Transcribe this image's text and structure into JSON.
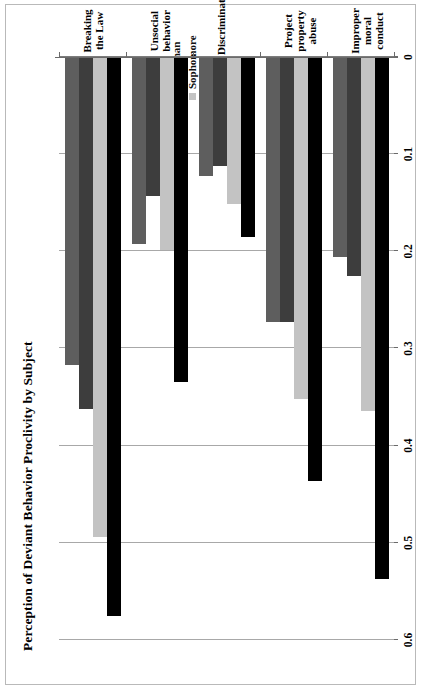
{
  "chart_data": {
    "type": "bar",
    "orientation": "horizontal",
    "title": "Perception of Deviant Behavior Proclivity by Subject",
    "xlabel": "",
    "ylabel": "",
    "xlim": [
      0,
      0.6
    ],
    "x_axis_reversed": true,
    "grid": true,
    "legend_position": "top-right",
    "rotation": "page rotated 90 degrees counter-clockwise",
    "tick_labels": [
      "0.6",
      "0.5",
      "0.4",
      "0.3",
      "0.2",
      "0.1",
      "0"
    ],
    "tick_values": [
      0.6,
      0.5,
      0.4,
      0.3,
      0.2,
      0.1,
      0
    ],
    "categories": [
      "Breaking the Law",
      "Unsocial behavior",
      "Discrimination",
      "Project property abuse",
      "Improper moral conduct"
    ],
    "series": [
      {
        "name": "Freshman",
        "color": "#000000",
        "values": [
          0.575,
          0.335,
          0.185,
          0.436,
          0.537
        ]
      },
      {
        "name": "Sophomore",
        "color": "#c3c3c3",
        "values": [
          0.494,
          0.199,
          0.151,
          0.352,
          0.364
        ]
      },
      {
        "name": "Junior",
        "color": "#3d3d3d",
        "values": [
          0.362,
          0.143,
          0.112,
          0.273,
          0.225
        ]
      },
      {
        "name": "Senior",
        "color": "#5e5e5e",
        "values": [
          0.317,
          0.192,
          0.122,
          0.273,
          0.206
        ]
      }
    ]
  },
  "legend": {
    "items": [
      {
        "label": "Freshman",
        "color": "#000000"
      },
      {
        "label": "Sophomore",
        "color": "#c3c3c3"
      },
      {
        "label": "Junior",
        "color": "#3d3d3d"
      },
      {
        "label": "Senior",
        "color": "#5e5e5e"
      }
    ]
  },
  "axis": {
    "ticks": [
      {
        "label": "0.6",
        "value": 0.6
      },
      {
        "label": "0.5",
        "value": 0.5
      },
      {
        "label": "0.4",
        "value": 0.4
      },
      {
        "label": "0.3",
        "value": 0.3
      },
      {
        "label": "0.2",
        "value": 0.2
      },
      {
        "label": "0.1",
        "value": 0.1
      },
      {
        "label": "0",
        "value": 0
      }
    ]
  }
}
